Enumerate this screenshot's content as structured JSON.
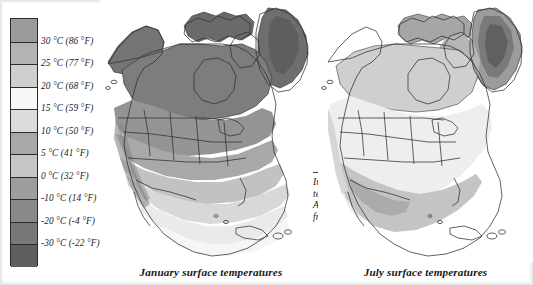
{
  "legend": {
    "name": "temperature-scale",
    "bands": [
      {
        "label": "",
        "color": "#9a9a9a",
        "above": true
      },
      {
        "label": "30 °C (86 °F)",
        "color": "#b3b3b3"
      },
      {
        "label": "25 °C (77 °F)",
        "color": "#cfcfcf"
      },
      {
        "label": "20 °C (68 °F)",
        "color": "#f7f7f7"
      },
      {
        "label": "15 °C (59 °F)",
        "color": "#dcdcdc"
      },
      {
        "label": "10 °C (50 °F)",
        "color": "#a8a8a8"
      },
      {
        "label": "5 °C (41 °F)",
        "color": "#c6c6c6"
      },
      {
        "label": "0 °C (32 °F)",
        "color": "#9d9d9d"
      },
      {
        "label": "-10 °C (14 °F)",
        "color": "#8a8a8a"
      },
      {
        "label": "-20 °C (-4 °F)",
        "color": "#787878"
      },
      {
        "label": "-30 °C (-22 °F)",
        "color": "#5e5e5e"
      }
    ]
  },
  "maps": [
    {
      "id": "january",
      "caption": "January surface temperatures",
      "annotation": "In January most of the temperate parts of North America will encounter frost",
      "region": "North America"
    },
    {
      "id": "july",
      "caption": "July surface temperatures",
      "annotation": "In July only polar regions have frost – temperate regions are frost-free",
      "region": "North America"
    }
  ],
  "chart_data": {
    "type": "heatmap",
    "subtitle": "January and July comparison",
    "legend_position": "left",
    "legend_title": "",
    "units": [
      "°C",
      "°F"
    ],
    "scale_stops_c": [
      30,
      25,
      20,
      15,
      10,
      5,
      0,
      -10,
      -20,
      -30
    ],
    "scale_stops_f": [
      86,
      77,
      68,
      59,
      50,
      41,
      32,
      14,
      -4,
      -22
    ],
    "panels": [
      {
        "name": "January surface temperatures",
        "description": "Most of Canada, Alaska and Greenland below -10 °C; the US interior 0 to -10 °C; the Gulf coast and Mexico 10-20 °C; southern Mexico, Florida and the Caribbean 20-25 °C",
        "annotation": "In January most of the temperate parts of North America will encounter frost"
      },
      {
        "name": "July surface temperatures",
        "description": "Most of the continent 20-25 °C; the south-west US and northern Mexico above 25-30 °C; the Canadian Arctic archipelago 5-10 °C; the Greenland ice sheet remains below -10 to -30 °C",
        "annotation": "In July only polar regions have frost – temperate regions are frost-free"
      }
    ]
  }
}
